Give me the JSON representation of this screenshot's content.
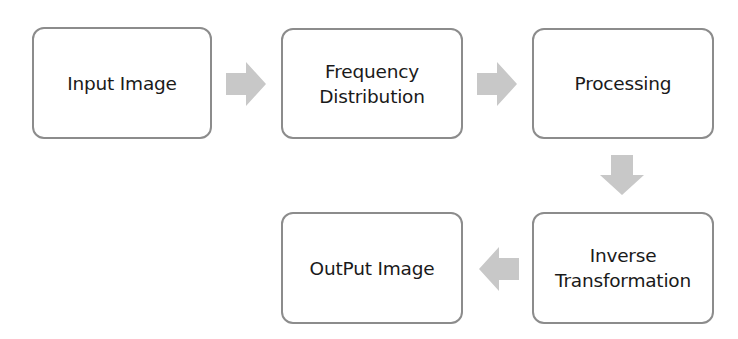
{
  "diagram": {
    "type": "flowchart",
    "colors": {
      "box_border": "#8c8c8c",
      "box_fill": "#ffffff",
      "arrow_fill": "#c8c8c8",
      "text": "#1a1a1a"
    },
    "nodes": [
      {
        "id": "input-image",
        "lines": [
          "Input Image"
        ]
      },
      {
        "id": "frequency-distribution",
        "lines": [
          "Frequency",
          "Distribution"
        ]
      },
      {
        "id": "processing",
        "lines": [
          "Processing"
        ]
      },
      {
        "id": "inverse-transformation",
        "lines": [
          "Inverse",
          "Transformation"
        ]
      },
      {
        "id": "output-image",
        "lines": [
          "OutPut Image"
        ]
      }
    ],
    "edges": [
      {
        "from": "input-image",
        "to": "frequency-distribution",
        "direction": "right"
      },
      {
        "from": "frequency-distribution",
        "to": "processing",
        "direction": "right"
      },
      {
        "from": "processing",
        "to": "inverse-transformation",
        "direction": "down"
      },
      {
        "from": "inverse-transformation",
        "to": "output-image",
        "direction": "left"
      }
    ]
  }
}
